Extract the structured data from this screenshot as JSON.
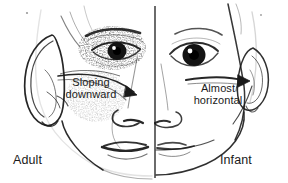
{
  "figure": {
    "width": 288,
    "height": 183,
    "background_color": "#ffffff",
    "ink_color": "#1a1a1a"
  },
  "annotations": {
    "left_callout": {
      "line1": "Sloping",
      "line2": "downward",
      "full_text": "Sloping downward",
      "side": "Adult"
    },
    "right_callout": {
      "line1": "Almost",
      "line2": "horizontal",
      "full_text": "Almost horizontal",
      "side": "Infant"
    }
  },
  "side_labels": {
    "left": "Adult",
    "right": "Infant"
  },
  "icons": {
    "adult_ear": "ear-icon",
    "infant_ear": "ear-icon",
    "adult_eye": "eye-icon",
    "infant_eye": "eye-icon",
    "divider": "vertical-divider-icon",
    "left_pointer": "arrow-pointer-icon",
    "right_pointer": "arrow-pointer-icon"
  },
  "colors": {
    "ink": "#1a1a1a",
    "paper": "#ffffff",
    "soft_gray": "#6f6f6f"
  }
}
